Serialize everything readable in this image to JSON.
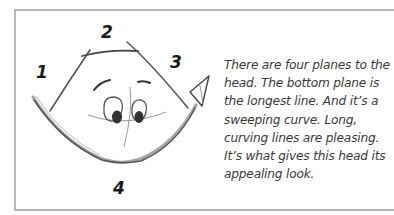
{
  "illustration": {
    "subject": "cartoon head with four planes",
    "plane_labels": [
      "1",
      "2",
      "3",
      "4"
    ]
  },
  "caption": {
    "lines": [
      "There are four planes to the",
      "head. The bottom plane is",
      "the longest line. And it’s a",
      "sweeping curve. Long,",
      "curving lines are pleasing.",
      "It’s what gives this head its",
      "appealing look."
    ]
  },
  "colors": {
    "frame": "#b8b8b8",
    "ink": "#2a2a2a",
    "caption_text": "#3a3a3a"
  }
}
